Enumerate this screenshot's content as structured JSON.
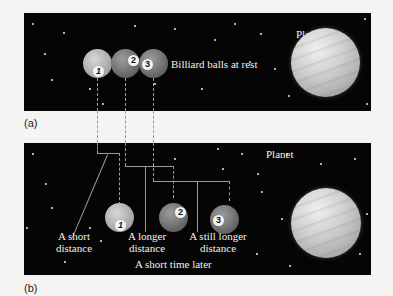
{
  "panel_a": {
    "label": "(a)",
    "planet_label": "Planet",
    "balls_label": "Billiard balls at rest",
    "balls": [
      {
        "number": "1"
      },
      {
        "number": "2"
      },
      {
        "number": "3"
      }
    ]
  },
  "panel_b": {
    "label": "(b)",
    "planet_label": "Planet",
    "balls": [
      {
        "number": "1"
      },
      {
        "number": "2"
      },
      {
        "number": "3"
      }
    ],
    "distance_labels": [
      {
        "line1": "A short",
        "line2": "distance"
      },
      {
        "line1": "A longer",
        "line2": "distance"
      },
      {
        "line1": "A still longer",
        "line2": "distance"
      }
    ],
    "caption": "A short time later"
  },
  "colors": {
    "space": "#050505",
    "background": "#f4f4f2",
    "guide_lines": "#9a9a9a"
  }
}
